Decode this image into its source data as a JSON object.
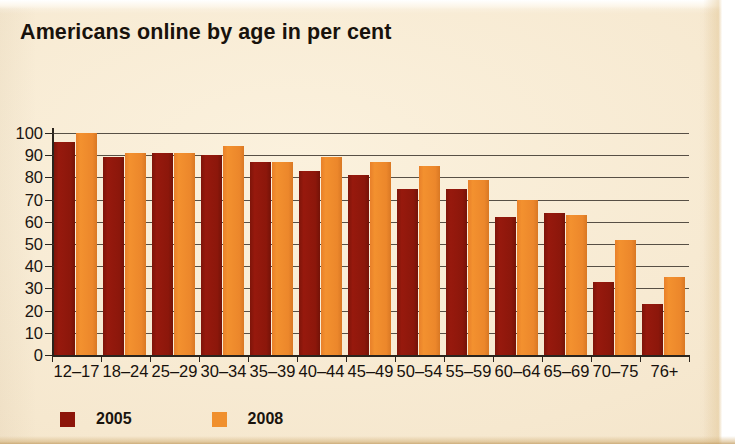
{
  "title": "Americans online by age in per cent",
  "colors": {
    "background": "#f7ead2",
    "series_2005": "#90180c",
    "series_2008": "#ef8b2d",
    "axis": "#2a241d",
    "text": "#17110c"
  },
  "legend": {
    "position": "bottom-left",
    "items": [
      {
        "label": "2005",
        "color": "#8d1509"
      },
      {
        "label": "2008",
        "color": "#f0902e"
      }
    ]
  },
  "axis": {
    "y_ticks": [
      "100",
      "90",
      "80",
      "70",
      "60",
      "50",
      "40",
      "30",
      "20",
      "10",
      "0"
    ],
    "y_min": 0,
    "y_max": 100,
    "y_step": 10
  },
  "chart_data": {
    "type": "bar",
    "title": "Americans online by age in per cent",
    "xlabel": "",
    "ylabel": "",
    "ylim": [
      0,
      100
    ],
    "grid": true,
    "legend_position": "bottom-left",
    "categories": [
      "12–17",
      "18–24",
      "25–29",
      "30–34",
      "35–39",
      "40–44",
      "45–49",
      "50–54",
      "55–59",
      "60–64",
      "65–69",
      "70–75",
      "76+"
    ],
    "series": [
      {
        "name": "2005",
        "color": "#90180c",
        "values": [
          96,
          89,
          91,
          90,
          87,
          83,
          81,
          75,
          75,
          62,
          64,
          33,
          23
        ]
      },
      {
        "name": "2008",
        "color": "#ef8b2d",
        "values": [
          100,
          91,
          91,
          94,
          87,
          89,
          87,
          85,
          79,
          70,
          63,
          52,
          35
        ]
      }
    ]
  }
}
